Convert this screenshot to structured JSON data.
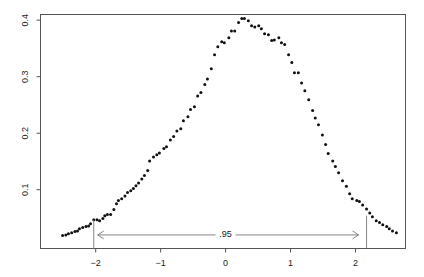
{
  "chart_data": {
    "type": "scatter",
    "title": "",
    "xlabel": "",
    "ylabel": "",
    "xlim": [
      -2.85,
      2.77
    ],
    "ylim": [
      -0.004,
      0.41
    ],
    "grid": false,
    "legend": "none",
    "x_ticks": [
      -2,
      -1,
      0,
      1,
      2
    ],
    "x_tick_labels": [
      "−2",
      "−1",
      "0",
      "1",
      "2"
    ],
    "y_ticks": [
      0.1,
      0.2,
      0.3,
      0.4
    ],
    "y_tick_labels": [
      "0.1",
      "0.2",
      "0.3",
      "0.4"
    ],
    "series": [
      {
        "name": "density",
        "x": [
          -2.51,
          -2.46,
          -2.42,
          -2.37,
          -2.32,
          -2.28,
          -2.25,
          -2.2,
          -2.15,
          -2.11,
          -2.08,
          -2.03,
          -1.98,
          -1.94,
          -1.89,
          -1.86,
          -1.82,
          -1.77,
          -1.72,
          -1.68,
          -1.65,
          -1.6,
          -1.55,
          -1.51,
          -1.46,
          -1.42,
          -1.38,
          -1.34,
          -1.29,
          -1.25,
          -1.2,
          -1.17,
          -1.11,
          -1.06,
          -1.02,
          -0.95,
          -0.91,
          -0.85,
          -0.8,
          -0.75,
          -0.69,
          -0.65,
          -0.58,
          -0.54,
          -0.48,
          -0.43,
          -0.38,
          -0.32,
          -0.28,
          -0.22,
          -0.17,
          -0.12,
          -0.06,
          -0.02,
          0.05,
          0.09,
          0.14,
          0.2,
          0.25,
          0.29,
          0.35,
          0.4,
          0.45,
          0.51,
          0.55,
          0.6,
          0.66,
          0.71,
          0.75,
          0.82,
          0.86,
          0.91,
          0.97,
          1.02,
          1.06,
          1.12,
          1.17,
          1.22,
          1.28,
          1.34,
          1.38,
          1.43,
          1.49,
          1.54,
          1.58,
          1.65,
          1.69,
          1.74,
          1.8,
          1.86,
          1.91,
          1.95,
          2.02,
          2.06,
          2.11,
          2.17,
          2.22,
          2.26,
          2.32,
          2.37,
          2.42,
          2.48,
          2.52,
          2.57,
          2.63
        ],
        "y": [
          0.019,
          0.02,
          0.022,
          0.024,
          0.026,
          0.027,
          0.031,
          0.033,
          0.035,
          0.036,
          0.04,
          0.047,
          0.047,
          0.045,
          0.049,
          0.054,
          0.056,
          0.056,
          0.065,
          0.075,
          0.081,
          0.084,
          0.089,
          0.095,
          0.098,
          0.102,
          0.107,
          0.112,
          0.119,
          0.125,
          0.134,
          0.151,
          0.158,
          0.162,
          0.165,
          0.173,
          0.176,
          0.188,
          0.194,
          0.204,
          0.208,
          0.222,
          0.229,
          0.242,
          0.247,
          0.266,
          0.272,
          0.286,
          0.296,
          0.314,
          0.339,
          0.353,
          0.362,
          0.36,
          0.369,
          0.381,
          0.381,
          0.396,
          0.403,
          0.403,
          0.399,
          0.39,
          0.388,
          0.39,
          0.385,
          0.376,
          0.374,
          0.364,
          0.365,
          0.369,
          0.36,
          0.357,
          0.339,
          0.325,
          0.307,
          0.307,
          0.289,
          0.275,
          0.259,
          0.24,
          0.227,
          0.215,
          0.197,
          0.18,
          0.164,
          0.151,
          0.141,
          0.13,
          0.116,
          0.106,
          0.093,
          0.084,
          0.081,
          0.079,
          0.073,
          0.066,
          0.059,
          0.052,
          0.045,
          0.042,
          0.038,
          0.035,
          0.031,
          0.027,
          0.024
        ]
      }
    ],
    "annotations": {
      "interval_lower": -2.03,
      "interval_upper": 2.17,
      "lower_line_height": 0.047,
      "upper_line_height": 0.054,
      "arrow_y": 0.02,
      "arrow_label": ".95",
      "arrow_label_x": 0.0
    }
  }
}
